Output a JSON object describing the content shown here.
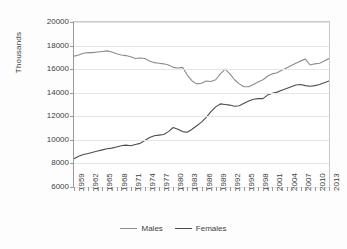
{
  "chart_data": {
    "type": "line",
    "title": "",
    "xlabel": "",
    "ylabel": "Thousands",
    "ylim": [
      6000,
      20000
    ],
    "ytick_step": 2000,
    "ytick_labels": [
      "6000",
      "8000",
      "10000",
      "12000",
      "14000",
      "16000",
      "18000",
      "20000"
    ],
    "xlim": [
      1959,
      2013
    ],
    "grid": true,
    "legend_position": "bottom",
    "xtick_labels": [
      "1959",
      "1962",
      "1965",
      "1968",
      "1971",
      "1974",
      "1977",
      "1980",
      "1983",
      "1986",
      "1989",
      "1992",
      "1995",
      "1998",
      "2001",
      "2004",
      "2007",
      "2010",
      "2013"
    ],
    "xtick_label_step": 3,
    "x": [
      1959,
      1960,
      1961,
      1962,
      1963,
      1964,
      1965,
      1966,
      1967,
      1968,
      1969,
      1970,
      1971,
      1972,
      1973,
      1974,
      1975,
      1976,
      1977,
      1978,
      1979,
      1980,
      1981,
      1982,
      1983,
      1984,
      1985,
      1986,
      1987,
      1988,
      1989,
      1990,
      1991,
      1992,
      1993,
      1994,
      1995,
      1996,
      1997,
      1998,
      1999,
      2000,
      2001,
      2002,
      2003,
      2004,
      2005,
      2006,
      2007,
      2008,
      2009,
      2010,
      2011,
      2012,
      2013
    ],
    "series": [
      {
        "name": "Males",
        "color": "#8c8c8c",
        "values": [
          17100,
          17200,
          17350,
          17400,
          17400,
          17450,
          17500,
          17550,
          17450,
          17300,
          17200,
          17150,
          17050,
          16900,
          16950,
          16900,
          16700,
          16550,
          16500,
          16450,
          16350,
          16150,
          16100,
          16150,
          15500,
          15000,
          14750,
          14800,
          15000,
          14950,
          15100,
          15600,
          16000,
          15600,
          15100,
          14750,
          14500,
          14500,
          14700,
          14900,
          15100,
          15400,
          15600,
          15700,
          15900,
          16100,
          16300,
          16500,
          16700,
          16850,
          16350,
          16450,
          16500,
          16700,
          16900
        ]
      },
      {
        "name": "Females",
        "color": "#4d4d4d",
        "values": [
          8400,
          8600,
          8750,
          8850,
          8950,
          9050,
          9150,
          9250,
          9300,
          9400,
          9500,
          9550,
          9500,
          9600,
          9700,
          9950,
          10200,
          10350,
          10400,
          10450,
          10700,
          11050,
          10900,
          10700,
          10650,
          10900,
          11200,
          11500,
          11900,
          12400,
          12800,
          13050,
          13000,
          12950,
          12850,
          12900,
          13100,
          13300,
          13450,
          13500,
          13500,
          13800,
          13950,
          14050,
          14200,
          14350,
          14500,
          14650,
          14700,
          14600,
          14550,
          14600,
          14700,
          14850,
          15000
        ]
      }
    ]
  },
  "legend": {
    "entries": [
      {
        "label": "Males"
      },
      {
        "label": "Females"
      }
    ]
  }
}
